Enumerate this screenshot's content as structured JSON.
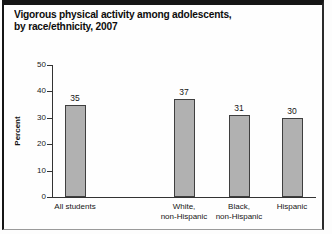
{
  "figure": {
    "title_line1": "Vigorous physical activity among adolescents,",
    "title_line2": "by race/ethnicity, 2007"
  },
  "chart_data": {
    "type": "bar",
    "title": "Vigorous physical activity among adolescents, by race/ethnicity, 2007",
    "categories": [
      "All students",
      "White,\nnon-Hispanic",
      "Black,\nnon-Hispanic",
      "Hispanic"
    ],
    "values": [
      35,
      37,
      31,
      30
    ],
    "value_labels": [
      "35",
      "37",
      "31",
      "30"
    ],
    "xlabel": "",
    "ylabel": "Percent",
    "ylim": [
      0,
      50
    ],
    "yticks": [
      0,
      10,
      20,
      30,
      40,
      50
    ],
    "grid": "off",
    "legend": "none",
    "layout_hints": {
      "bar_centers_px": [
        75,
        184,
        239,
        292
      ],
      "bar_width_px": 21,
      "plot_left_px": 52,
      "plot_baseline_px": 197,
      "plot_top_px": 65,
      "axis_right_end_px": 316,
      "note": "All-students bar separated by a wide gap from the three race/ethnicity bars"
    },
    "colors": {
      "bar_fill": "#b1b1b1",
      "bar_border": "#3f3f3f",
      "axis": "#333333",
      "text": "#111111",
      "frame": "#151515"
    }
  }
}
